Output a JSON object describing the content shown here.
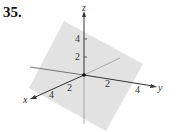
{
  "problem": {
    "number": "35."
  },
  "figure": {
    "type": "3d-axes-with-plane",
    "axes": {
      "x": {
        "label": "x",
        "ticks": [
          "2",
          "4"
        ]
      },
      "y": {
        "label": "y",
        "ticks": [
          "2",
          "4"
        ]
      },
      "z": {
        "label": "z",
        "ticks": [
          "2",
          "4"
        ]
      }
    },
    "plane_color": "#e0e0e0",
    "axis_color": "#333333"
  }
}
